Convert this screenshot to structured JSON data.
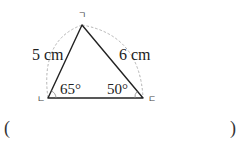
{
  "diagram": {
    "type": "triangle",
    "vertices": {
      "top": "ㄱ",
      "bottom_left": "ㄴ",
      "bottom_right": "ㄷ"
    },
    "sides": {
      "left": "5 cm",
      "right": "6 cm"
    },
    "angles": {
      "bottom_left": "65°",
      "bottom_right": "50°"
    },
    "construction_arcs": "dashed"
  },
  "answer": {
    "open_paren": "(",
    "close_paren": ")"
  }
}
